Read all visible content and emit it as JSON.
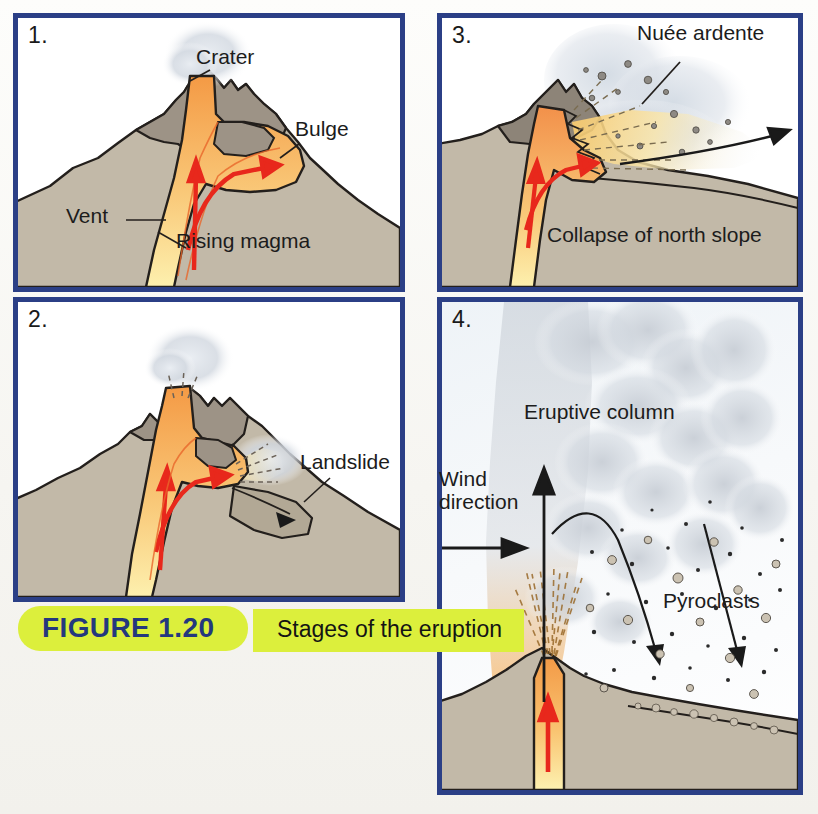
{
  "figure": {
    "number_label": "FIGURE 1.20",
    "caption": "Stages of the eruption",
    "accent_green": "#dcef3c",
    "accent_blue": "#24387e",
    "border_blue": "#2b3f86"
  },
  "palette": {
    "mountain_fill": "#c2b9a8",
    "mountain_dark": "#8d8478",
    "magma_orange": "#f4a14f",
    "magma_yellow": "#fdeaa0",
    "arrow_red": "#e8281c",
    "ash_gray": "#c9ced6",
    "outline": "#231f1c"
  },
  "panels": [
    {
      "id": "panel-1",
      "number": "1.",
      "labels": [
        {
          "name": "crater",
          "text": "Crater",
          "x": 196,
          "y": 46
        },
        {
          "name": "bulge",
          "text": "Bulge",
          "x": 295,
          "y": 118
        },
        {
          "name": "vent",
          "text": "Vent",
          "x": 66,
          "y": 205
        },
        {
          "name": "rising-magma",
          "text": "Rising magma",
          "x": 176,
          "y": 230
        }
      ]
    },
    {
      "id": "panel-2",
      "number": "2.",
      "labels": [
        {
          "name": "landslide",
          "text": "Landslide",
          "x": 300,
          "y": 451
        }
      ]
    },
    {
      "id": "panel-3",
      "number": "3.",
      "labels": [
        {
          "name": "nuee-ardente",
          "text": "Nuée ardente",
          "x": 637,
          "y": 22
        },
        {
          "name": "collapse-north-slope",
          "text": "Collapse of north slope",
          "x": 547,
          "y": 224
        }
      ]
    },
    {
      "id": "panel-4",
      "number": "4.",
      "labels": [
        {
          "name": "eruptive-column",
          "text": "Eruptive column",
          "x": 524,
          "y": 401
        },
        {
          "name": "wind-direction",
          "text": "Wind\ndirection",
          "x": 439,
          "y": 468
        },
        {
          "name": "pyroclasts",
          "text": "Pyroclasts",
          "x": 663,
          "y": 590
        }
      ]
    }
  ]
}
